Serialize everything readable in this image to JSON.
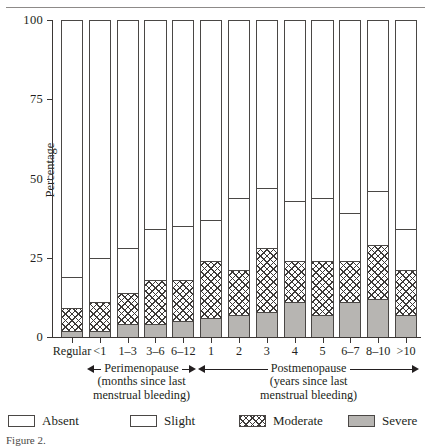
{
  "figure": {
    "caption_fragment": "Figure 2."
  },
  "chart_data": {
    "type": "bar",
    "subtype": "stacked-bar-100",
    "title": "",
    "xlabel": "",
    "ylabel": "Percentage",
    "ylim": [
      0,
      100
    ],
    "yticks": [
      0,
      25,
      50,
      75,
      100
    ],
    "grid": false,
    "legend_position": "bottom",
    "stacked_order_bottom_to_top": [
      "Severe",
      "Moderate",
      "Slight",
      "Absent"
    ],
    "categories": [
      "Regular",
      "<1",
      "1–3",
      "3–6",
      "6–12",
      "1",
      "2",
      "3",
      "4",
      "5",
      "6–7",
      "8–10",
      ">10"
    ],
    "series": [
      {
        "name": "Severe",
        "fill": "solid-gray",
        "color": "#b7b5b2",
        "values": [
          2,
          2,
          4,
          4,
          5,
          6,
          7,
          8,
          11,
          7,
          11,
          12,
          7
        ]
      },
      {
        "name": "Moderate",
        "fill": "crosshatch",
        "color": "#ffffff",
        "values": [
          7,
          9,
          10,
          14,
          13,
          18,
          14,
          20,
          13,
          17,
          13,
          17,
          14
        ]
      },
      {
        "name": "Slight",
        "fill": "white",
        "color": "#ffffff",
        "values": [
          10,
          14,
          14,
          16,
          17,
          13,
          23,
          19,
          19,
          20,
          15,
          17,
          13
        ]
      },
      {
        "name": "Absent",
        "fill": "white",
        "color": "#ffffff",
        "values": [
          81,
          75,
          72,
          66,
          65,
          63,
          56,
          53,
          57,
          56,
          61,
          54,
          66
        ]
      }
    ],
    "annotations": [
      {
        "label": "Perimenopause",
        "sublabel_line1": "(months since last",
        "sublabel_line2": "menstrual bleeding)",
        "arrow": "double",
        "spans_categories": [
          "<1",
          "1–3",
          "3–6",
          "6–12"
        ]
      },
      {
        "label": "Postmenopause",
        "sublabel_line1": "(years since last",
        "sublabel_line2": "menstrual bleeding)",
        "arrow": "double",
        "spans_categories": [
          "1",
          "2",
          "3",
          "4",
          "5",
          "6–7",
          "8–10",
          ">10"
        ]
      }
    ]
  },
  "legend": {
    "items": [
      {
        "label": "Absent",
        "swatch": "white-box"
      },
      {
        "label": "Slight",
        "swatch": "white-box"
      },
      {
        "label": "Moderate",
        "swatch": "crosshatch-box"
      },
      {
        "label": "Severe",
        "swatch": "gray-box"
      }
    ]
  }
}
